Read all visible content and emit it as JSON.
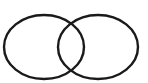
{
  "diagram": {
    "type": "venn",
    "sets": [
      {
        "id": "left",
        "label": "",
        "cx": 44,
        "cy": 47,
        "rx": 40,
        "ry": 32
      },
      {
        "id": "right",
        "label": "",
        "cx": 98,
        "cy": 47,
        "rx": 40,
        "ry": 32
      }
    ],
    "stroke_color": "#1a1a1a",
    "fill_color": "#ffffff",
    "stroke_width": 2.4
  }
}
